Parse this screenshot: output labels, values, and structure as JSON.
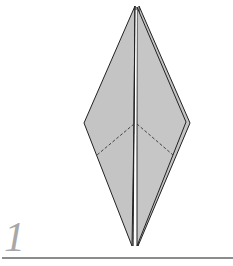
{
  "diagram": {
    "step_number": "1",
    "colors": {
      "paper_fill": "#c4c4c4",
      "outline": "#222222",
      "fold_line": "#333333",
      "step_number": "#a8a8a8",
      "rule": "#8c8c8c",
      "background": "#ffffff"
    },
    "shape": "kite / bird base, two front flaps, valley-fold dashed lines at lower edges"
  }
}
